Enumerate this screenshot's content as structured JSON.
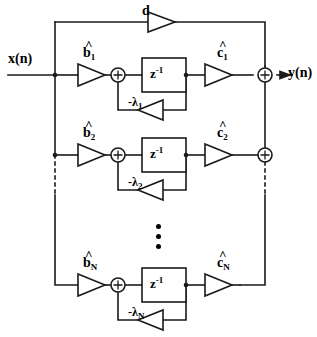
{
  "diagram": {
    "input_label": "x(n)",
    "output_label": "y(n)",
    "feedforward_gain_label": "d",
    "delay_label_base": "z",
    "delay_label_exponent": "-1",
    "hat_symbol": "^",
    "stages": [
      {
        "index": "1",
        "b_label": "b",
        "b_subscript": "1",
        "c_label": "c",
        "c_subscript": "1",
        "lambda_label": "-λ",
        "lambda_subscript": "1",
        "delay_base": "z",
        "delay_exp": "-1"
      },
      {
        "index": "2",
        "b_label": "b",
        "b_subscript": "2",
        "c_label": "c",
        "c_subscript": "2",
        "lambda_label": "-λ",
        "lambda_subscript": "2",
        "delay_base": "z",
        "delay_exp": "-1"
      },
      {
        "index": "N",
        "b_label": "b",
        "b_subscript": "N",
        "c_label": "c",
        "c_subscript": "N",
        "lambda_label": "-λ",
        "lambda_subscript": "N",
        "delay_base": "z",
        "delay_exp": "-1"
      }
    ],
    "adder_symbol": "+",
    "ellipsis_dots": 3,
    "colors": {
      "line": "#1a1a1a",
      "text": "#000000",
      "background": "#ffffff"
    }
  }
}
